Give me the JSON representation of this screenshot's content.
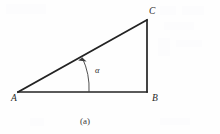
{
  "figure": {
    "caption": "(a)",
    "shape_name": "right-triangle",
    "vertices": [
      {
        "id": "A",
        "label": "A",
        "x": 18,
        "y": 92,
        "label_x": 11,
        "label_y": 101
      },
      {
        "id": "B",
        "label": "B",
        "x": 147,
        "y": 92,
        "label_x": 152,
        "label_y": 101
      },
      {
        "id": "C",
        "label": "C",
        "x": 147,
        "y": 20,
        "label_x": 149,
        "label_y": 14
      }
    ],
    "sides": [
      {
        "name": "base-AB",
        "from": "A",
        "to": "B"
      },
      {
        "name": "vertical-BC",
        "from": "B",
        "to": "C"
      },
      {
        "name": "hypotenuse-AC",
        "from": "A",
        "to": "C"
      }
    ],
    "angle": {
      "label": "α",
      "at_vertex": "A",
      "label_x": 95,
      "label_y": 73,
      "arc_path": "M 89 92 A 71 71 0 0 0 82.2 57.6",
      "arrow_points": "82.2,57.6 86.4,61.2 78.4,60.6",
      "arrow_tip_x": 82,
      "arrow_tip_y": 57
    },
    "caption_x": 85,
    "caption_y": 124,
    "colors": {
      "background": "#fefefe",
      "stroke": "#232323",
      "arc": "#3b3b3b",
      "label": "#262626",
      "caption": "#3a3a3a"
    }
  }
}
